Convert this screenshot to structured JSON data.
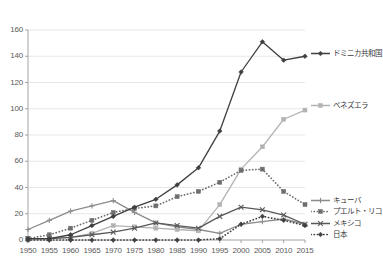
{
  "chart_data": {
    "type": "line",
    "title": "",
    "xlabel": "",
    "ylabel": "",
    "x": [
      1950,
      1955,
      1960,
      1965,
      1970,
      1975,
      1980,
      1985,
      1990,
      1995,
      2000,
      2005,
      2010,
      2015
    ],
    "xticklabels": [
      "1950",
      "1955",
      "1960",
      "1965",
      "1970",
      "1975",
      "1980",
      "1985",
      "1990",
      "1995",
      "2000",
      "2005",
      "2010",
      "2015"
    ],
    "yticklabels": [
      "0",
      "20",
      "40",
      "60",
      "80",
      "100",
      "120",
      "140",
      "160"
    ],
    "yticks": [
      0,
      20,
      40,
      60,
      80,
      100,
      120,
      140,
      160
    ],
    "ylim": [
      0,
      160
    ],
    "xlim": [
      1950,
      2015
    ],
    "grid": "horizontal",
    "legend_position": "right",
    "series": [
      {
        "name": "ドミニカ共和国",
        "color": "#3f3f3f",
        "style": "solid",
        "marker": "diamond",
        "values": [
          1,
          1,
          4,
          11,
          18,
          25,
          31,
          42,
          55,
          83,
          128,
          151,
          137,
          140
        ]
      },
      {
        "name": "ベネズエラ",
        "color": "#b3b3b3",
        "style": "solid",
        "marker": "square",
        "values": [
          0,
          1,
          2,
          5,
          11,
          10,
          9,
          8,
          7,
          27,
          54,
          71,
          92,
          99
        ]
      },
      {
        "name": "キューバ",
        "color": "#8c8c8c",
        "style": "solid",
        "marker": "plus",
        "values": [
          8,
          15,
          22,
          26,
          30,
          21,
          13,
          10,
          8,
          5,
          12,
          14,
          16,
          12
        ]
      },
      {
        "name": "プエルト・リコ",
        "color": "#6e6e6e",
        "style": "dotted",
        "marker": "square",
        "values": [
          1,
          4,
          9,
          15,
          21,
          24,
          26,
          33,
          37,
          44,
          53,
          54,
          37,
          27
        ]
      },
      {
        "name": "メキシコ",
        "color": "#595959",
        "style": "solid",
        "marker": "x",
        "values": [
          1,
          1,
          2,
          4,
          6,
          9,
          13,
          11,
          9,
          18,
          25,
          23,
          19,
          12
        ]
      },
      {
        "name": "日本",
        "color": "#404040",
        "style": "dotted",
        "marker": "diamond",
        "values": [
          0,
          0,
          0,
          0,
          0,
          0,
          0,
          0,
          0,
          1,
          12,
          18,
          15,
          11
        ]
      }
    ]
  },
  "legend": {
    "items": [
      {
        "label": "ドミニカ共和国"
      },
      {
        "label": "ベネズエラ"
      },
      {
        "label": "キューバ"
      },
      {
        "label": "プエルト・リコ"
      },
      {
        "label": "メキシコ"
      },
      {
        "label": "日本"
      }
    ]
  }
}
